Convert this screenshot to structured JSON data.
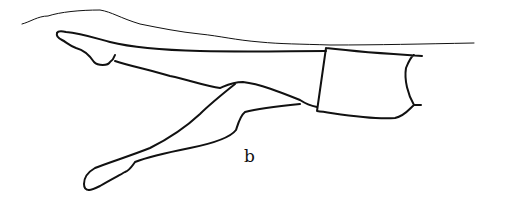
{
  "figure": {
    "label": "b",
    "stroke_color": "#111111",
    "background": "#ffffff"
  }
}
